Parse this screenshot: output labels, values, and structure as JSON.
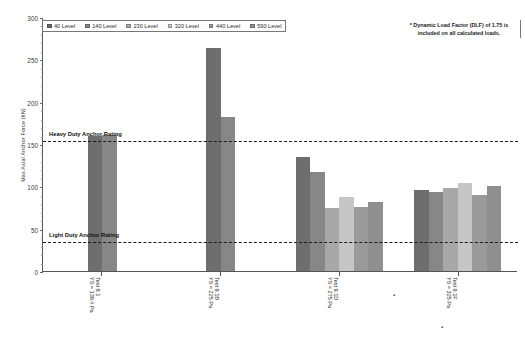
{
  "chart_data": {
    "type": "bar",
    "title": "",
    "xlabel": "",
    "ylabel": "Max Axial Anchor Force (kN)",
    "ylim": [
      0,
      300
    ],
    "ytick_step": 50,
    "yticks": [
      0,
      50,
      100,
      150,
      200,
      250,
      300
    ],
    "grid": false,
    "legend_position": "top-left",
    "categories": [
      "Test 9.1\nYS = 139.4 Pa",
      "Test 9.1B\nYS = 225 Pa",
      "Test 9.1D\nYS = 275 Pa",
      "Test 9.1F\nYS = 325 Pa"
    ],
    "category_labels": [
      {
        "line1": "Test 9.1",
        "line2": "YS = 139.4 Pa"
      },
      {
        "line1": "Test 9.1B",
        "line2": "YS = 225 Pa"
      },
      {
        "line1": "Test 9.1D",
        "line2": "YS = 275 Pa"
      },
      {
        "line1": "Test 9.1F",
        "line2": "YS = 325 Pa"
      }
    ],
    "series": [
      {
        "name": "40 Level",
        "color": "#6e6e6e",
        "values": [
          160,
          263,
          135,
          96
        ]
      },
      {
        "name": "140 Level",
        "color": "#878787",
        "values": [
          161,
          182,
          117,
          93
        ]
      },
      {
        "name": "230 Level",
        "color": "#a8a8a8",
        "values": [
          null,
          null,
          75,
          98
        ]
      },
      {
        "name": "320 Level",
        "color": "#c6c6c6",
        "values": [
          null,
          null,
          88,
          104
        ]
      },
      {
        "name": "440 Level",
        "color": "#9a9a9a",
        "values": [
          null,
          null,
          76,
          90
        ]
      },
      {
        "name": "590 Level",
        "color": "#8f8f8f",
        "values": [
          null,
          null,
          82,
          101
        ]
      }
    ],
    "reference_lines": [
      {
        "label": "Heavy Duty Anchor Rating",
        "value": 155
      },
      {
        "label": "Light Duty Anchor Rating",
        "value": 36
      }
    ],
    "annotations": [
      "* Dynamic Load Factor (DLF) of 1.75 is included on all calculated loads."
    ]
  },
  "note": {
    "line1": "* Dynamic Load Factor (DLF) of 1.75 is",
    "line2": "included on all calculated loads."
  },
  "axis": {
    "y_title": "Max Axial Anchor Force (kN)",
    "y_ticks": [
      "300",
      "250",
      "200",
      "150",
      "100",
      "50",
      "0"
    ]
  },
  "legend": {
    "items": [
      {
        "label": "40 Level"
      },
      {
        "label": "140 Level"
      },
      {
        "label": "230 Level"
      },
      {
        "label": "320 Level"
      },
      {
        "label": "440 Level"
      },
      {
        "label": "590 Level"
      }
    ]
  },
  "reference": {
    "heavy": "Heavy Duty Anchor Rating",
    "light": "Light Duty Anchor Rating"
  }
}
